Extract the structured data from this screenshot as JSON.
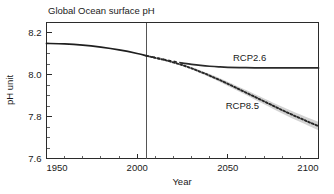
{
  "chart_data": {
    "type": "line",
    "title": "Global Ocean surface pH",
    "xlabel": "Year",
    "ylabel": "pH unit",
    "xlim": [
      1950,
      2100
    ],
    "ylim": [
      7.6,
      8.25
    ],
    "xticks": [
      "1950",
      "2000",
      "2050",
      "2100"
    ],
    "xtick_values": [
      1950,
      2000,
      2050,
      2100
    ],
    "xtick_minor_step": 10,
    "yticks": [
      "8.2",
      "8.0",
      "7.8",
      "7.6"
    ],
    "ytick_values": [
      8.2,
      8.0,
      7.8,
      7.6
    ],
    "ytick_minor_step": 0.05,
    "grid": false,
    "legend_position": "inline-annotation",
    "divider_year": 2005,
    "series": [
      {
        "name": "Historical",
        "style": "solid",
        "x": [
          1950,
          1960,
          1970,
          1980,
          1990,
          2000,
          2005
        ],
        "values": [
          8.15,
          8.148,
          8.142,
          8.132,
          8.119,
          8.102,
          8.091
        ]
      },
      {
        "name": "RCP2.6",
        "label": "RCP2.6",
        "style": "dashed-then-solid",
        "dashed_until": 2025,
        "x": [
          2005,
          2010,
          2015,
          2020,
          2025,
          2030,
          2035,
          2040,
          2045,
          2050,
          2060,
          2070,
          2080,
          2090,
          2100
        ],
        "values": [
          8.091,
          8.082,
          8.073,
          8.064,
          8.056,
          8.05,
          8.045,
          8.041,
          8.038,
          8.036,
          8.034,
          8.033,
          8.033,
          8.033,
          8.033
        ]
      },
      {
        "name": "RCP8.5",
        "label": "RCP8.5",
        "style": "dotted",
        "has_uncertainty_band": true,
        "x": [
          2005,
          2010,
          2015,
          2020,
          2025,
          2030,
          2035,
          2040,
          2045,
          2050,
          2055,
          2060,
          2065,
          2070,
          2075,
          2080,
          2085,
          2090,
          2095,
          2100
        ],
        "values": [
          8.091,
          8.081,
          8.071,
          8.059,
          8.046,
          8.031,
          8.014,
          7.996,
          7.977,
          7.957,
          7.936,
          7.915,
          7.894,
          7.873,
          7.852,
          7.831,
          7.811,
          7.792,
          7.773,
          7.755
        ],
        "band_lower": [
          8.091,
          8.079,
          8.068,
          8.055,
          8.041,
          8.025,
          8.007,
          7.988,
          7.968,
          7.947,
          7.925,
          7.903,
          7.881,
          7.859,
          7.837,
          7.815,
          7.794,
          7.774,
          7.754,
          7.735
        ],
        "band_upper": [
          8.091,
          8.083,
          8.074,
          8.063,
          8.051,
          8.037,
          8.021,
          8.004,
          7.986,
          7.967,
          7.947,
          7.927,
          7.907,
          7.887,
          7.867,
          7.847,
          7.828,
          7.81,
          7.792,
          7.775
        ]
      }
    ],
    "annotations": [
      {
        "text": "RCP2.6",
        "year": 2062,
        "ph": 8.068
      },
      {
        "text": "RCP8.5",
        "year": 2058,
        "ph": 7.838
      }
    ]
  },
  "colors": {
    "background": "#ffffff",
    "axis": "#2b2b2b",
    "series_line": "#1f1f1f",
    "uncertainty_band": "#c9c9c9",
    "divider": "#555555"
  }
}
